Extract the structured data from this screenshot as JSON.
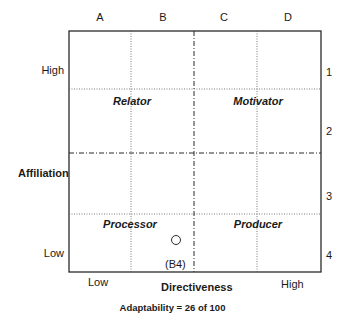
{
  "columns": [
    "A",
    "B",
    "C",
    "D"
  ],
  "rows": [
    "1",
    "2",
    "3",
    "4"
  ],
  "y_axis": {
    "title": "Affiliation",
    "high": "High",
    "low": "Low"
  },
  "x_axis": {
    "title": "Directiveness",
    "low": "Low",
    "high": "High"
  },
  "quadrants": {
    "top_left": "Relator",
    "top_right": "Motivator",
    "bottom_left": "Processor",
    "bottom_right": "Producer"
  },
  "marker": {
    "cell": "(B4)",
    "column": "B",
    "row": "4"
  },
  "footer": "Adaptability = 26 of 100",
  "colors": {
    "line": "#2a2a2a",
    "grid": "#555555",
    "background": "#ffffff"
  }
}
